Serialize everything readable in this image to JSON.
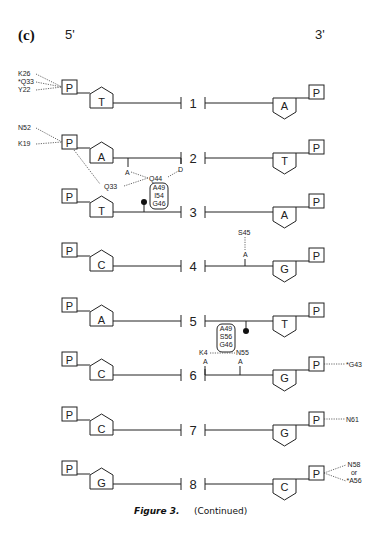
{
  "panel_label": "(c)",
  "end_labels": {
    "left": "5'",
    "right": "3'"
  },
  "phosphate_label": "P",
  "caption": {
    "figure": "Figure 3.",
    "note": "(Continued)"
  },
  "pairs": [
    {
      "number": "1",
      "left_base": "T",
      "left_shaded": false,
      "right_base": "A",
      "right_shaded": false,
      "left_contacts": [
        "K26",
        "*Q33",
        "Y22"
      ],
      "right_contacts": []
    },
    {
      "number": "2",
      "left_base": "A",
      "left_shaded": true,
      "right_base": "T",
      "right_shaded": false,
      "left_contacts": [
        "N52",
        "K19"
      ],
      "right_contacts": []
    },
    {
      "number": "3",
      "left_base": "T",
      "left_shaded": true,
      "right_base": "A",
      "right_shaded": false,
      "left_contacts": [],
      "right_contacts": []
    },
    {
      "number": "4",
      "left_base": "C",
      "left_shaded": false,
      "right_base": "G",
      "right_shaded": true,
      "left_contacts": [],
      "right_contacts": []
    },
    {
      "number": "5",
      "left_base": "A",
      "left_shaded": false,
      "right_base": "T",
      "right_shaded": true,
      "left_contacts": [],
      "right_contacts": []
    },
    {
      "number": "6",
      "left_base": "C",
      "left_shaded": false,
      "right_base": "G",
      "right_shaded": true,
      "left_contacts": [],
      "right_contacts": [
        "*G43"
      ]
    },
    {
      "number": "7",
      "left_base": "C",
      "left_shaded": false,
      "right_base": "G",
      "right_shaded": false,
      "left_contacts": [],
      "right_contacts": [
        "N61"
      ]
    },
    {
      "number": "8",
      "left_base": "G",
      "left_shaded": false,
      "right_base": "C",
      "right_shaded": false,
      "left_contacts": [],
      "right_contacts": [
        "N58",
        "or",
        "*A56"
      ]
    }
  ],
  "groove_annotations": {
    "pair2_3": {
      "acceptor_a": "A",
      "donor_d": "D",
      "residue_q33": "Q33",
      "residue_q44": "Q44",
      "vdw_box": [
        "A49",
        "I54",
        "G46"
      ]
    },
    "pair4": {
      "acceptor_a": "A",
      "residue": "S45"
    },
    "pair5_6": {
      "vdw_box": [
        "A49",
        "S56",
        "G46"
      ],
      "residue_k4": "K4",
      "residue_n55": "N55",
      "acceptor_a1": "A",
      "acceptor_a2": "A"
    }
  }
}
